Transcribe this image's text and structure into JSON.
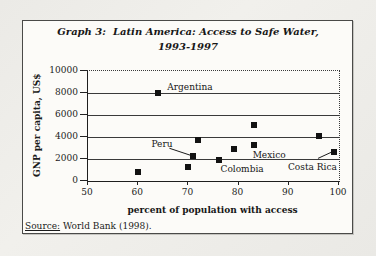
{
  "figure": {
    "title_line1": "Graph 3:  Latin America: Access to Safe Water,",
    "title_line2": "1993-1997",
    "source_label": "Source:",
    "source_text": " World Bank (1998)."
  },
  "chart_data": {
    "type": "scatter",
    "title": "Graph 3: Latin America: Access to Safe Water, 1993-1997",
    "xlabel": "percent of population with access",
    "ylabel": "GNP per capita, US$",
    "xlim": [
      50,
      100
    ],
    "ylim": [
      0,
      10000
    ],
    "x_ticks": [
      50,
      60,
      70,
      80,
      90,
      100
    ],
    "y_ticks": [
      0,
      2000,
      4000,
      6000,
      8000,
      10000
    ],
    "grid": "horizontal-solid, top-and-right-borders-dotted",
    "legend": "none",
    "marker": "black-filled-square",
    "points": [
      {
        "x": 60,
        "y": 800
      },
      {
        "x": 64,
        "y": 8000,
        "label": "Argentina",
        "label_dx": 9,
        "label_dy": -11
      },
      {
        "x": 70,
        "y": 1250
      },
      {
        "x": 71,
        "y": 2250,
        "label": "Peru",
        "label_dx": -42,
        "label_dy": -17,
        "connector": [
          -24,
          -8,
          -3,
          -1
        ]
      },
      {
        "x": 72,
        "y": 3750
      },
      {
        "x": 76,
        "y": 1950,
        "label": "Colombia",
        "label_dx": 2,
        "label_dy": 4
      },
      {
        "x": 79,
        "y": 2950
      },
      {
        "x": 83,
        "y": 3300,
        "label": "Mexico",
        "label_dx": -1,
        "label_dy": 5
      },
      {
        "x": 83,
        "y": 5100
      },
      {
        "x": 96,
        "y": 4100
      },
      {
        "x": 99,
        "y": 2600,
        "label": "Costa Rica",
        "label_dx": -46,
        "label_dy": 10,
        "connector": [
          -16,
          6,
          -3,
          0
        ]
      }
    ]
  }
}
